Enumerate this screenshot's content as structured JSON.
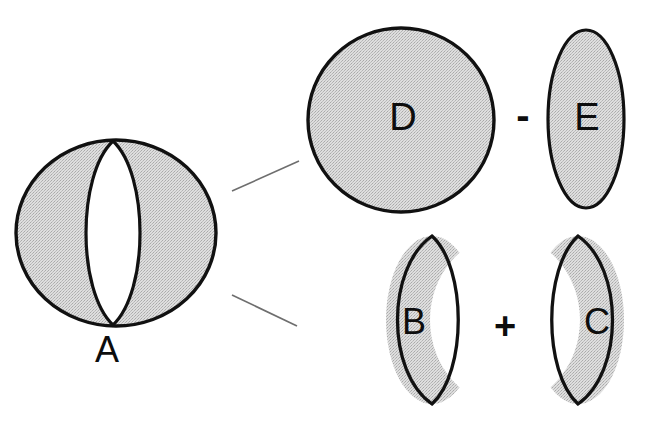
{
  "figure": {
    "type": "set-decomposition-diagram",
    "background_color": "#ffffff",
    "stroke_color": "#111111",
    "fill_gray": "#d2d2d2",
    "fill_white": "#ffffff",
    "connector_color": "#6e6e6e"
  },
  "shapes": {
    "a": {
      "label": "A",
      "description": "circle with white central lens leaving two gray crescents",
      "label_x": 107,
      "label_y": 352,
      "circle": {
        "cx": 116,
        "cy": 233,
        "rx": 100,
        "ry": 93
      },
      "lens": {
        "cx": 113,
        "cy": 233,
        "rx": 36,
        "ry": 92
      }
    },
    "d": {
      "label": "D",
      "description": "solid gray circle",
      "label_x": 403,
      "label_y": 120,
      "ellipse": {
        "cx": 401,
        "cy": 120,
        "rx": 93,
        "ry": 92
      }
    },
    "e": {
      "label": "E",
      "description": "solid gray tall ellipse",
      "label_x": 587,
      "label_y": 120,
      "ellipse": {
        "cx": 586,
        "cy": 119,
        "rx": 38,
        "ry": 89
      }
    },
    "b": {
      "label": "B",
      "description": "gray crescent, concave side facing right",
      "label_x": 414,
      "label_y": 324,
      "bbox": {
        "x": 385,
        "y": 236,
        "width": 93,
        "height": 168
      }
    },
    "c": {
      "label": "C",
      "description": "gray crescent, concave side facing left",
      "label_x": 597,
      "label_y": 324,
      "bbox": {
        "x": 532,
        "y": 236,
        "width": 93,
        "height": 168
      }
    }
  },
  "operators": {
    "minus": {
      "symbol": "-",
      "x": 523,
      "y": 120
    },
    "plus": {
      "symbol": "+",
      "x": 505,
      "y": 329
    }
  },
  "connectors": [
    {
      "name": "connector-to-top-expression",
      "x1": 232,
      "y1": 191,
      "x2": 299,
      "y2": 161
    },
    {
      "name": "connector-to-bottom-expression",
      "x1": 232,
      "y1": 295,
      "x2": 297,
      "y2": 326
    }
  ]
}
